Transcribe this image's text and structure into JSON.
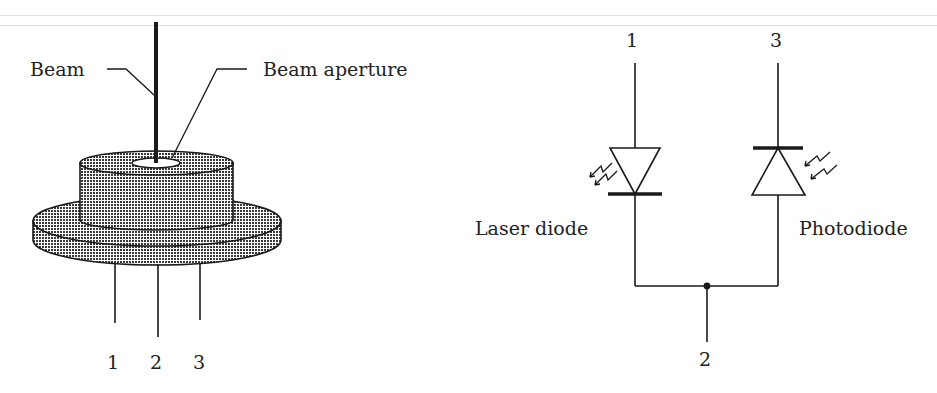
{
  "figure": {
    "left_panel": {
      "title": "Laser diode package (physical view)",
      "labels": {
        "beam": "Beam",
        "beam_aperture": "Beam aperture"
      },
      "pins": [
        "1",
        "2",
        "3"
      ]
    },
    "right_panel": {
      "title": "Equivalent circuit",
      "labels": {
        "laser_diode": "Laser diode",
        "photodiode": "Photodiode"
      },
      "terminals": {
        "top_left": "1",
        "top_right": "3",
        "bottom": "2"
      }
    },
    "colors": {
      "line": "#1a1a1a",
      "fill_pattern_dark": "#333333",
      "fill_pattern_light": "#ffffff",
      "rule": "#e2e2e2"
    }
  }
}
